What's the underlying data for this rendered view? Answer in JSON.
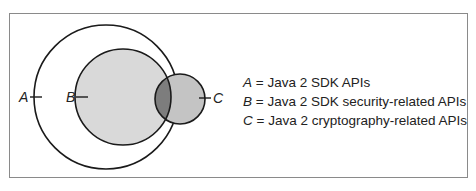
{
  "diagram": {
    "type": "venn",
    "sets": [
      {
        "key": "A",
        "label": "A",
        "description": "Java 2 SDK APIs"
      },
      {
        "key": "B",
        "label": "B",
        "description": "Java 2 SDK security-related APIs"
      },
      {
        "key": "C",
        "label": "C",
        "description": "Java 2 cryptography-related APIs"
      }
    ],
    "legend": [
      {
        "key": "A",
        "sep": " = ",
        "text": "Java 2 SDK APIs"
      },
      {
        "key": "B",
        "sep": " = ",
        "text": "Java 2 SDK security-related APIs"
      },
      {
        "key": "C",
        "sep": " = ",
        "text": "Java 2 cryptography-related APIs"
      }
    ],
    "colors": {
      "stroke": "#1a1a1a",
      "fill_b": "#d9d9d9",
      "fill_c": "#c4c4c4",
      "fill_bc_overlap": "#7d7d7d",
      "frame": "#8a8a8a"
    }
  }
}
